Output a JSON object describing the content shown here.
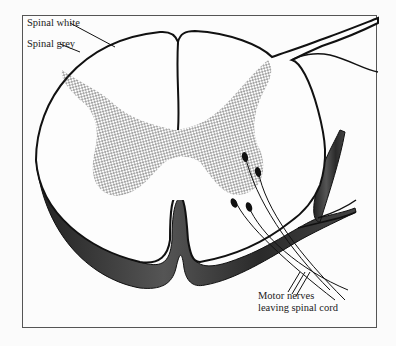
{
  "figure": {
    "type": "spinal cord cross-section",
    "labels": {
      "spinal_white": "Spinal white",
      "spinal_grey": "Spinal grey",
      "motor_nerves_line1": "Motor nerves",
      "motor_nerves_line2": "leaving spinal cord"
    },
    "colors": {
      "outline": "#111111",
      "grey_matter_dots": "#333333",
      "pia_shading": "#3a3a3a",
      "frame": "#555555",
      "background": "#fcfcfc"
    }
  }
}
